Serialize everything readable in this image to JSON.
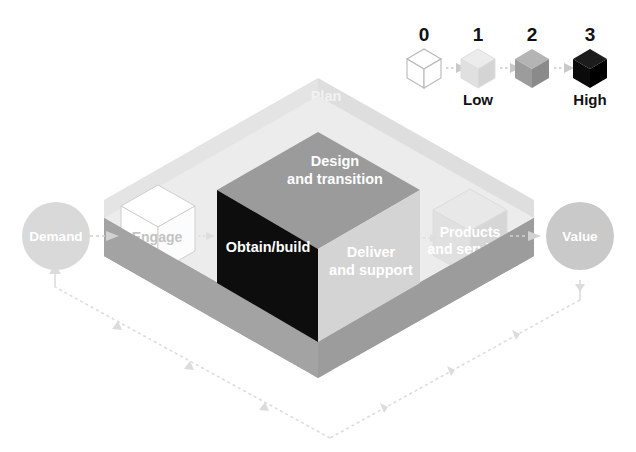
{
  "diagram": {
    "legend": {
      "items": [
        {
          "num": "0",
          "caption": "",
          "color": "#ffffff",
          "top": "#ffffff",
          "left": "#ffffff",
          "right": "#ffffff",
          "stroke": "#b8b8b8"
        },
        {
          "num": "1",
          "caption": "Low",
          "color": "#e2e2e2",
          "top": "#ececec",
          "left": "#e0e0e0",
          "right": "#d2d2d2",
          "stroke": "#d8d8d8"
        },
        {
          "num": "2",
          "caption": "",
          "color": "#9f9f9f",
          "top": "#b4b4b4",
          "left": "#9c9c9c",
          "right": "#8a8a8a",
          "stroke": "#9a9a9a"
        },
        {
          "num": "3",
          "caption": "High",
          "color": "#0d0d0d",
          "top": "#1c1c1c",
          "left": "#0b0b0b",
          "right": "#000000",
          "stroke": "#000000"
        }
      ]
    },
    "endpoints": {
      "demand": {
        "label": "Demand",
        "fill": "#d9d9d9",
        "text": "#ffffff"
      },
      "value": {
        "label": "Value",
        "fill": "#c9c9c9",
        "text": "#ffffff"
      }
    },
    "platform": {
      "back_wall_label": "Plan",
      "back_wall_fill": "#dcdcdc",
      "base_front_label": "Improve",
      "base_left_fill": "#a3a3a3",
      "base_right_fill": "#9c9c9c",
      "base_top_fill": "#ebebeb"
    },
    "central_cube": {
      "top_label": "Design and transition",
      "top_line1": "Design",
      "top_line2": "and transition",
      "top_fill": "#9b9b9b",
      "left_label": "Obtain/build",
      "left_fill": "#0d0d0d",
      "right_line1": "Deliver",
      "right_line2": "and support",
      "right_fill": "#d4d4d4",
      "text_color": "#ffffff"
    },
    "small_cubes": [
      {
        "name": "engage",
        "label": "Engage",
        "top_fill": "#ffffff",
        "left_fill": "#ffffff",
        "right_fill": "#fafafa",
        "stroke": "#cfcfcf",
        "text_color": "#c2c2c2"
      },
      {
        "name": "products-and-services",
        "line1": "Products",
        "line2": "and services",
        "top_fill": "#e6e6e6",
        "left_fill": "#dedede",
        "right_fill": "#d4d4d4",
        "stroke": "#d8d8d8",
        "text_color": "#ffffff"
      }
    ],
    "flow_arrows": [
      {
        "name": "demand-to-engage",
        "from": "Demand",
        "to": "Engage"
      },
      {
        "name": "engage-to-obtain",
        "from": "Engage",
        "to": "Obtain/build"
      },
      {
        "name": "deliver-to-products",
        "from": "Deliver and support",
        "to": "Products and services"
      },
      {
        "name": "products-to-value",
        "from": "Products and services",
        "to": "Value"
      }
    ],
    "feedback_loop": {
      "name": "value-to-demand-feedback",
      "from": "Value",
      "to": "Demand",
      "style": "dotted",
      "color": "#dcdcdc"
    }
  }
}
